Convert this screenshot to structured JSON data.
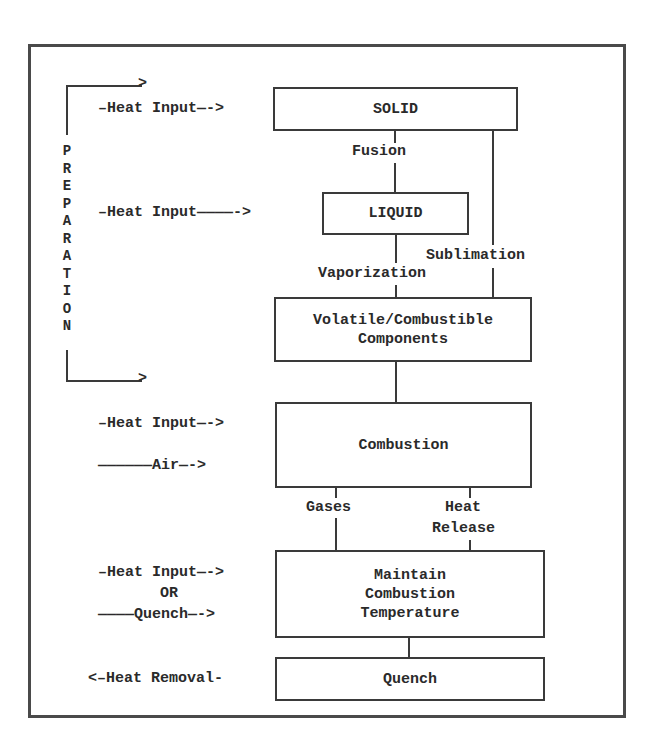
{
  "diagram": {
    "side_label": "PREPARATION",
    "side_letters": [
      "P",
      "R",
      "E",
      "P",
      "A",
      "R",
      "A",
      "T",
      "I",
      "O",
      "N"
    ],
    "boxes": {
      "solid": "SOLID",
      "liquid": "LIQUID",
      "volatile_line1": "Volatile/Combustible",
      "volatile_line2": "Components",
      "combustion": "Combustion",
      "maintain_line1": "Maintain",
      "maintain_line2": "Combustion",
      "maintain_line3": "Temperature",
      "quench": "Quench"
    },
    "edges": {
      "fusion": "Fusion",
      "vaporization": "Vaporization",
      "sublimation": "Sublimation",
      "gases": "Gases",
      "heat_release_line1": "Heat",
      "heat_release_line2": "Release"
    },
    "inputs": {
      "solid_heat": "–Heat Input—->",
      "liquid_heat": "–Heat Input————->",
      "combustion_heat": "–Heat Input—->",
      "combustion_air": "——————Air—->",
      "maintain_heat": "–Heat Input—->",
      "maintain_or": "OR",
      "maintain_quench": "————Quench—->",
      "quench_removal": "<–Heat Removal-"
    },
    "colors": {
      "ink": "#2a2a2a",
      "line": "#3a3a3a",
      "frame": "#4a4a4a"
    }
  }
}
